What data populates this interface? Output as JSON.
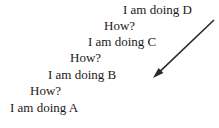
{
  "diagram": {
    "background_color": "#ffffff",
    "text_color": "#1a1a1a",
    "arrow_color": "#2b2b2b",
    "lines": [
      {
        "text": "I am doing D",
        "x": 123,
        "y": 2
      },
      {
        "text": "How?",
        "x": 104,
        "y": 18
      },
      {
        "text": "I am doing C",
        "x": 88,
        "y": 34
      },
      {
        "text": "How?",
        "x": 70,
        "y": 50
      },
      {
        "text": "I am doing B",
        "x": 48,
        "y": 67
      },
      {
        "text": "How?",
        "x": 30,
        "y": 83
      },
      {
        "text": "I am doing A",
        "x": 10,
        "y": 100
      }
    ],
    "arrow": {
      "name": "diagonal-arrow-down-left",
      "x1": 214,
      "y1": 20,
      "x2": 153,
      "y2": 78,
      "stroke_width": 1.6,
      "head_length": 11,
      "head_width": 7
    }
  }
}
